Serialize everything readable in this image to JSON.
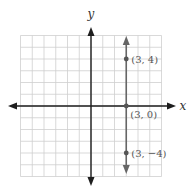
{
  "chart_data": {
    "type": "line",
    "title": "",
    "xlabel": "x",
    "ylabel": "y",
    "xlim": [
      -6,
      6
    ],
    "ylim": [
      -6,
      6
    ],
    "grid": true,
    "grid_step": 1,
    "series": [
      {
        "name": "x = 3",
        "kind": "vertical-line",
        "x": [
          3,
          3,
          3
        ],
        "y": [
          4,
          0,
          -4
        ],
        "arrows": "both"
      }
    ],
    "points": [
      {
        "x": 3,
        "y": 4,
        "label": "(3, 4)"
      },
      {
        "x": 3,
        "y": 0,
        "label": "(3, 0)"
      },
      {
        "x": 3,
        "y": -4,
        "label": "(3, −4)"
      }
    ]
  },
  "colors": {
    "grid": "#cfcfcf",
    "axes": "#1e1e1e",
    "line": "#666666",
    "point": "#555555",
    "label": "#555555"
  }
}
